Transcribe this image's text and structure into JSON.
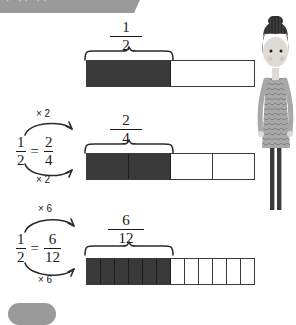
{
  "banner": {
    "text": "· ·· ··",
    "color": "#9a9a9a"
  },
  "bottom_pill": {
    "label": "",
    "color": "#9a9a9a"
  },
  "colors": {
    "filled": "#3a3a3a",
    "outline": "#3b3b3b",
    "empty": "#ffffff",
    "ink": "#1a1a1a"
  },
  "rows": [
    {
      "id": "row-half",
      "label": {
        "numerator": "1",
        "denominator": "2"
      },
      "total_cells": 2,
      "filled_cells": 1,
      "equation": null
    },
    {
      "id": "row-two-fourths",
      "label": {
        "numerator": "2",
        "denominator": "4"
      },
      "total_cells": 4,
      "filled_cells": 2,
      "equation": {
        "left": {
          "numerator": "1",
          "denominator": "2"
        },
        "sign": "=",
        "right": {
          "numerator": "2",
          "denominator": "4"
        },
        "top_operation": "× 2",
        "bottom_operation": "× 2"
      }
    },
    {
      "id": "row-six-twelfths",
      "label": {
        "numerator": "6",
        "denominator": "12"
      },
      "total_cells": 12,
      "filled_cells": 6,
      "equation": {
        "left": {
          "numerator": "1",
          "denominator": "2"
        },
        "sign": "=",
        "right": {
          "numerator": "6",
          "denominator": "12"
        },
        "top_operation": "× 6",
        "bottom_operation": "× 6"
      }
    }
  ],
  "illustration": {
    "name": "teacher-figure",
    "hair_color": "#2b2b2b",
    "skin_color": "#dedad6",
    "dress_color": "#a8a8a8",
    "leg_color": "#3a3a3a"
  }
}
